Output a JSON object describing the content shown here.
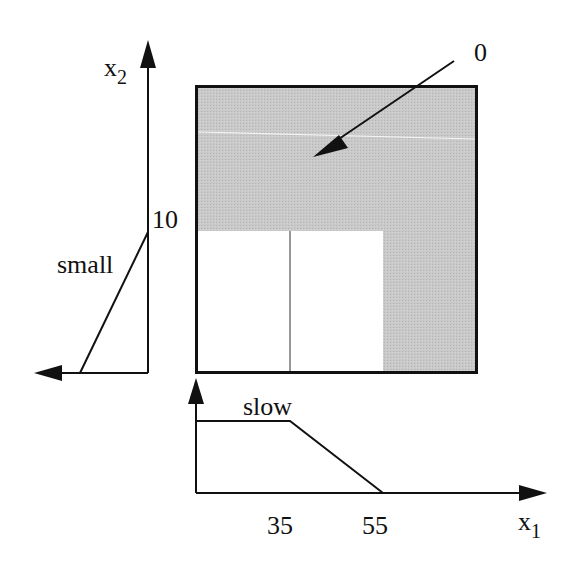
{
  "diagram": {
    "type": "fuzzy-membership-partition",
    "colors": {
      "shaded_region": "#c6c6c6",
      "unshaded_region": "#ffffff",
      "lines": "#111111",
      "background": "#ffffff"
    },
    "x2_axis": {
      "label": "x",
      "label_sub": "2",
      "tick_label": "10",
      "membership_label": "small"
    },
    "x1_axis": {
      "label": "x",
      "label_sub": "1",
      "tick_labels": [
        "35",
        "55"
      ],
      "membership_label": "slow"
    },
    "callout": {
      "label": "0"
    }
  }
}
